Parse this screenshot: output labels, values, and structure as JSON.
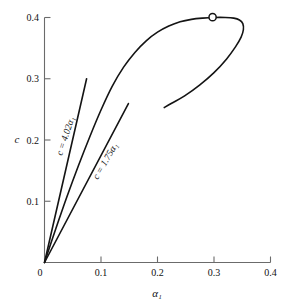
{
  "chart_data": {
    "type": "line",
    "title": "",
    "xlabel": "α₁",
    "ylabel": "c",
    "xlim": [
      0,
      0.4
    ],
    "ylim": [
      0,
      0.4
    ],
    "grid": false,
    "legend_position": "none",
    "xticks": [
      "0",
      "0.1",
      "0.2",
      "0.3",
      "0.4"
    ],
    "xtick_values": [
      0,
      0.1,
      0.2,
      0.3,
      0.4
    ],
    "yticks": [
      "0",
      "0.1",
      "0.2",
      "0.3",
      "0.4"
    ],
    "ytick_values": [
      0,
      0.1,
      0.2,
      0.3,
      0.4
    ],
    "series": [
      {
        "name": "main-equilibrium-curve",
        "style": "solid",
        "color": "#141414",
        "points": [
          [
            0.0,
            0.0
          ],
          [
            0.02,
            0.055
          ],
          [
            0.04,
            0.108
          ],
          [
            0.06,
            0.158
          ],
          [
            0.08,
            0.205
          ],
          [
            0.1,
            0.249
          ],
          [
            0.12,
            0.288
          ],
          [
            0.14,
            0.319
          ],
          [
            0.16,
            0.343
          ],
          [
            0.18,
            0.362
          ],
          [
            0.2,
            0.376
          ],
          [
            0.22,
            0.386
          ],
          [
            0.24,
            0.393
          ],
          [
            0.26,
            0.397
          ],
          [
            0.28,
            0.399
          ],
          [
            0.3,
            0.4
          ],
          [
            0.32,
            0.4
          ],
          [
            0.335,
            0.399
          ],
          [
            0.345,
            0.396
          ],
          [
            0.351,
            0.39
          ],
          [
            0.352,
            0.38
          ],
          [
            0.348,
            0.368
          ],
          [
            0.338,
            0.352
          ],
          [
            0.322,
            0.332
          ],
          [
            0.3,
            0.31
          ],
          [
            0.275,
            0.29
          ],
          [
            0.248,
            0.272
          ],
          [
            0.225,
            0.26
          ],
          [
            0.212,
            0.253
          ]
        ]
      },
      {
        "name": "tangent-line-4.02",
        "style": "solid",
        "color": "#141414",
        "points": [
          [
            0.0,
            0.0
          ],
          [
            0.0745,
            0.3
          ]
        ]
      },
      {
        "name": "tangent-line-1.75",
        "style": "solid",
        "color": "#141414",
        "points": [
          [
            0.0,
            0.0
          ],
          [
            0.1485,
            0.2595
          ]
        ]
      }
    ],
    "annotations": [
      {
        "name": "slope-label-402",
        "text": "c = 4.02α₁",
        "x": 0.042,
        "y": 0.205,
        "rotation": -72
      },
      {
        "name": "slope-label-175",
        "text": "c = 1.75α₁",
        "x": 0.112,
        "y": 0.163,
        "rotation": -60
      }
    ],
    "markers": [
      {
        "name": "critical-point-marker",
        "shape": "open-circle",
        "x": 0.2975,
        "y": 0.4005,
        "radius_px": 3.6
      }
    ]
  }
}
